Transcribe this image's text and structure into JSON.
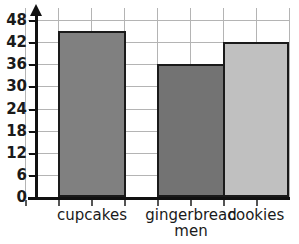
{
  "chart_data": {
    "type": "bar",
    "title": "",
    "subtitle": "",
    "xlabel": "",
    "ylabel": "",
    "categories": [
      "cupcakes",
      "gingerbread men",
      "cookies"
    ],
    "values": [
      45,
      36,
      42
    ],
    "series": [
      {
        "name": "",
        "values": [
          45,
          36,
          42
        ]
      }
    ],
    "ylim": [
      0,
      48
    ],
    "y_ticks": [
      0,
      6,
      12,
      18,
      24,
      30,
      36,
      42,
      48
    ],
    "y_tick_labels": [
      "0",
      "6",
      "12",
      "18",
      "24",
      "30",
      "36",
      "42",
      "48"
    ],
    "y_tick_interval": 6,
    "grid": true,
    "legend": false,
    "legend_position": "none",
    "bar_colors": [
      "#808080",
      "#737373",
      "#c0c0c0"
    ],
    "bar_border_color": "#1a1a1a",
    "axis_color": "#111111",
    "gridline_color": "#b4b4b4",
    "background": "#ffffff",
    "annotations": []
  },
  "axis": {
    "y_arrow_icon": "up-arrow-icon"
  },
  "categories_display": [
    {
      "line1": "cupcakes",
      "line2": ""
    },
    {
      "line1": "gingerbread",
      "line2": "men"
    },
    {
      "line1": "cookies",
      "line2": ""
    }
  ]
}
